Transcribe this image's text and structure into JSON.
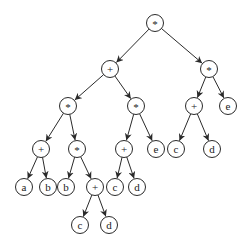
{
  "diagram": {
    "type": "expression-tree",
    "node_radius": 8.5,
    "colors": {
      "stroke": "#2a2a2a",
      "fill": "#ffffff",
      "text": "#222222"
    },
    "nodes": [
      {
        "id": "n0",
        "label": "*",
        "x": 155,
        "y": 23
      },
      {
        "id": "n1",
        "label": "+",
        "x": 110,
        "y": 69
      },
      {
        "id": "n2",
        "label": "*",
        "x": 209,
        "y": 69
      },
      {
        "id": "n3",
        "label": "*",
        "x": 68,
        "y": 106
      },
      {
        "id": "n4",
        "label": "*",
        "x": 136,
        "y": 106
      },
      {
        "id": "n5",
        "label": "+",
        "x": 194,
        "y": 106
      },
      {
        "id": "n6",
        "label": "e",
        "x": 228,
        "y": 106
      },
      {
        "id": "n7",
        "label": "+",
        "x": 41,
        "y": 149
      },
      {
        "id": "n8",
        "label": "*",
        "x": 77,
        "y": 149
      },
      {
        "id": "n9",
        "label": "+",
        "x": 124,
        "y": 149
      },
      {
        "id": "n10",
        "label": "e",
        "x": 156,
        "y": 149
      },
      {
        "id": "n11",
        "label": "c",
        "x": 176,
        "y": 149
      },
      {
        "id": "n12",
        "label": "d",
        "x": 212,
        "y": 149
      },
      {
        "id": "n13",
        "label": "a",
        "x": 24,
        "y": 187
      },
      {
        "id": "n14",
        "label": "b",
        "x": 48,
        "y": 187
      },
      {
        "id": "n15",
        "label": "b",
        "x": 66,
        "y": 187
      },
      {
        "id": "n16",
        "label": "+",
        "x": 95,
        "y": 187
      },
      {
        "id": "n17",
        "label": "c",
        "x": 115,
        "y": 187
      },
      {
        "id": "n18",
        "label": "d",
        "x": 137,
        "y": 187
      },
      {
        "id": "n19",
        "label": "c",
        "x": 80,
        "y": 225
      },
      {
        "id": "n20",
        "label": "d",
        "x": 109,
        "y": 225
      }
    ],
    "edges": [
      [
        "n0",
        "n1"
      ],
      [
        "n0",
        "n2"
      ],
      [
        "n1",
        "n3"
      ],
      [
        "n1",
        "n4"
      ],
      [
        "n2",
        "n5"
      ],
      [
        "n2",
        "n6"
      ],
      [
        "n3",
        "n7"
      ],
      [
        "n3",
        "n8"
      ],
      [
        "n4",
        "n9"
      ],
      [
        "n4",
        "n10"
      ],
      [
        "n5",
        "n11"
      ],
      [
        "n5",
        "n12"
      ],
      [
        "n7",
        "n13"
      ],
      [
        "n7",
        "n14"
      ],
      [
        "n8",
        "n15"
      ],
      [
        "n8",
        "n16"
      ],
      [
        "n9",
        "n17"
      ],
      [
        "n9",
        "n18"
      ],
      [
        "n16",
        "n19"
      ],
      [
        "n16",
        "n20"
      ]
    ]
  }
}
